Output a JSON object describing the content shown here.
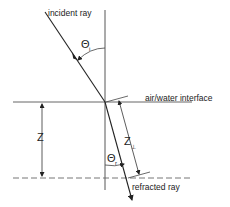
{
  "diagram": {
    "labels": {
      "incident_ray": "incident ray",
      "interface": "air/water interface",
      "refracted_ray": "refracted ray",
      "depth": "Z",
      "path_length": "Z",
      "path_length_sub": "⊥"
    },
    "angles": {
      "incident_symbol": "Θ",
      "incident_sub": "i",
      "refracted_symbol": "Θ",
      "refracted_sub": "r"
    },
    "colors": {
      "line": "#333333",
      "dashed": "#666666",
      "background": "#ffffff"
    }
  }
}
